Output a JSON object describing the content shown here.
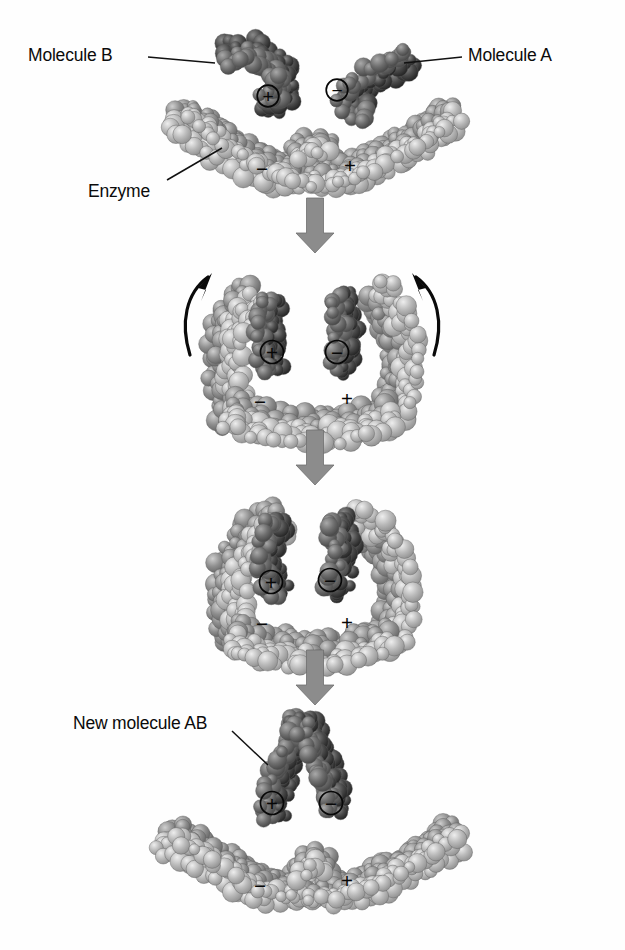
{
  "figure": {
    "type": "diagram",
    "background_color": "#fefefe",
    "width": 625,
    "height": 950
  },
  "labels": [
    {
      "id": "molecule-b",
      "text": "Molecule B",
      "x": 28,
      "y": 45,
      "anchor": "start",
      "leader": {
        "x1": 148,
        "y1": 57,
        "x2": 215,
        "y2": 63
      }
    },
    {
      "id": "molecule-a",
      "text": "Molecule A",
      "x": 468,
      "y": 45,
      "anchor": "start",
      "leader": {
        "x1": 404,
        "y1": 63,
        "x2": 462,
        "y2": 57
      }
    },
    {
      "id": "enzyme",
      "text": "Enzyme",
      "x": 88,
      "y": 181,
      "anchor": "start",
      "leader": {
        "x1": 167,
        "y1": 180,
        "x2": 222,
        "y2": 148
      }
    },
    {
      "id": "new-molecule-ab",
      "text": "New molecule AB",
      "x": 73,
      "y": 713,
      "anchor": "start",
      "leader": {
        "x1": 232,
        "y1": 731,
        "x2": 268,
        "y2": 765
      }
    }
  ],
  "stages": [
    {
      "id": "stage-1-substrates-approach",
      "name": "Substrates approach enzyme active site",
      "charges": [
        {
          "symbol": "+",
          "on": "molecule-b",
          "circled": true,
          "x": 268,
          "y": 96,
          "size": 15
        },
        {
          "symbol": "−",
          "on": "molecule-a",
          "circled": true,
          "x": 337,
          "y": 90,
          "size": 15
        },
        {
          "symbol": "−",
          "on": "enzyme",
          "circled": false,
          "x": 262,
          "y": 168,
          "size": 16
        },
        {
          "symbol": "+",
          "on": "enzyme",
          "circled": false,
          "x": 350,
          "y": 165,
          "size": 16
        }
      ]
    },
    {
      "id": "stage-2-induced-fit-closing",
      "name": "Enzyme changes shape around substrates",
      "motion_arrows": [
        {
          "id": "left-curved-arrow",
          "direction": "up-right",
          "x": 196,
          "y": 315
        },
        {
          "id": "right-curved-arrow",
          "direction": "up-left",
          "x": 428,
          "y": 315
        }
      ],
      "charges": [
        {
          "symbol": "+",
          "on": "molecule-b",
          "circled": true,
          "x": 272,
          "y": 352,
          "size": 16
        },
        {
          "symbol": "−",
          "on": "molecule-a",
          "circled": true,
          "x": 337,
          "y": 352,
          "size": 16
        },
        {
          "symbol": "−",
          "on": "enzyme",
          "circled": false,
          "x": 260,
          "y": 401,
          "size": 16
        },
        {
          "symbol": "+",
          "on": "enzyme",
          "circled": false,
          "x": 347,
          "y": 398,
          "size": 16
        }
      ]
    },
    {
      "id": "stage-3-reaction-complex",
      "name": "Substrates bound and joined in active site",
      "charges": [
        {
          "symbol": "+",
          "on": "molecule-b",
          "circled": true,
          "x": 271,
          "y": 582,
          "size": 16
        },
        {
          "symbol": "−",
          "on": "molecule-a",
          "circled": true,
          "x": 330,
          "y": 580,
          "size": 16
        },
        {
          "symbol": "−",
          "on": "enzyme",
          "circled": false,
          "x": 262,
          "y": 623,
          "size": 16
        },
        {
          "symbol": "+",
          "on": "enzyme",
          "circled": false,
          "x": 347,
          "y": 622,
          "size": 16
        }
      ]
    },
    {
      "id": "stage-4-product-release",
      "name": "New molecule AB released from enzyme",
      "charges": [
        {
          "symbol": "+",
          "on": "new-molecule-ab",
          "circled": true,
          "x": 272,
          "y": 803,
          "size": 16
        },
        {
          "symbol": "−",
          "on": "new-molecule-ab",
          "circled": true,
          "x": 331,
          "y": 803,
          "size": 16
        },
        {
          "symbol": "−",
          "on": "enzyme",
          "circled": false,
          "x": 260,
          "y": 885,
          "size": 16
        },
        {
          "symbol": "+",
          "on": "enzyme",
          "circled": false,
          "x": 347,
          "y": 880,
          "size": 16
        }
      ]
    }
  ],
  "flow_arrows": [
    {
      "id": "arrow-stage1-to-stage2",
      "x": 315,
      "y": 198,
      "height": 55,
      "color": "#8c8c8c"
    },
    {
      "id": "arrow-stage2-to-stage3",
      "x": 315,
      "y": 430,
      "height": 55,
      "color": "#8c8c8c"
    },
    {
      "id": "arrow-stage3-to-stage4",
      "x": 315,
      "y": 650,
      "height": 55,
      "color": "#8c8c8c"
    }
  ],
  "colors": {
    "enzyme_sphere": "#b9b9b9",
    "enzyme_sphere_dark": "#8e8e8e",
    "molecule_sphere": "#6e6e6e",
    "molecule_sphere_dark": "#4a4a4a",
    "arrow_gray": "#8c8c8c",
    "outline": "#5a5a5a",
    "text": "#0b0b0b"
  }
}
